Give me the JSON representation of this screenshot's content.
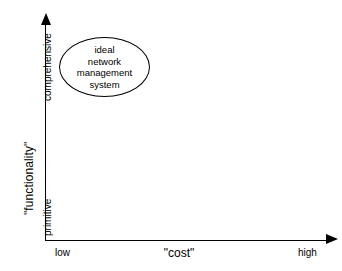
{
  "diagram": {
    "type": "2d-positioning-quadrant",
    "background_color": "#ffffff",
    "line_color": "#000000",
    "y_axis": {
      "title": "\"functionality\"",
      "tick_high": "comprehensive",
      "tick_low": "primitive",
      "arrow": "up-arrow-icon"
    },
    "x_axis": {
      "title": "\"cost\"",
      "tick_low": "low",
      "tick_high": "high",
      "arrow": "right-arrow-icon"
    },
    "nodes": [
      {
        "id": "ideal-network-management-system",
        "shape": "ellipse",
        "lines": [
          "ideal",
          "network",
          "management",
          "system"
        ],
        "position_hint": {
          "x": "low",
          "y": "comprehensive"
        }
      }
    ]
  },
  "chart_data": {
    "type": "scatter",
    "title": "",
    "xlabel": "\"cost\"",
    "ylabel": "\"functionality\"",
    "x_ticks": [
      "low",
      "high"
    ],
    "y_ticks": [
      "primitive",
      "comprehensive"
    ],
    "grid": false,
    "legend": null,
    "annotations": [
      {
        "label": "ideal network management system",
        "shape": "ellipse",
        "x_category": "low",
        "y_category": "comprehensive",
        "x_frac": 0.18,
        "y_frac": 0.88
      }
    ]
  }
}
